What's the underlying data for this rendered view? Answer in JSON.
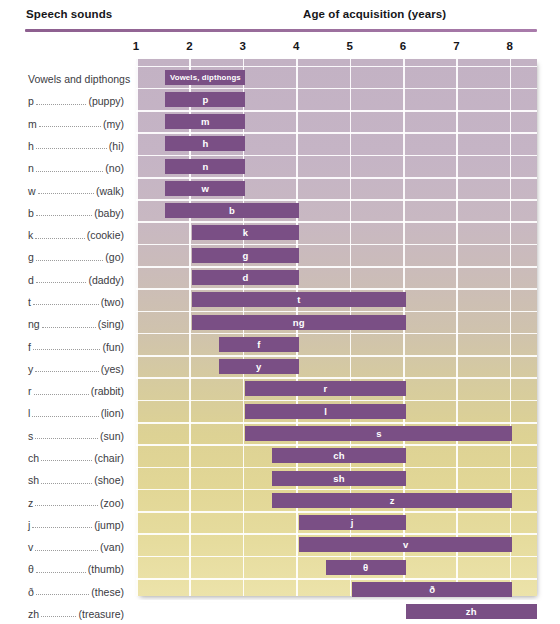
{
  "header": {
    "speech_sounds_label": "Speech sounds",
    "age_label": "Age of acquisition (years)"
  },
  "axis": {
    "ticks": [
      "1",
      "2",
      "3",
      "4",
      "5",
      "6",
      "7",
      "8"
    ],
    "tick_values": [
      1,
      2,
      3,
      4,
      5,
      6,
      7,
      8
    ],
    "xmin": 1,
    "xmax": 8.5,
    "rule_color": "#8d5f8f"
  },
  "colors": {
    "bar": "#7a4f85",
    "bar_text": "#ffffff",
    "grid": "#ffffff",
    "plot_top": "#c3b2c4",
    "plot_bottom": "#ecE3aa",
    "label_text": "#3b3b3f"
  },
  "chart_data": {
    "type": "bar",
    "title": "Age of acquisition (years)",
    "xlabel": "Age of acquisition (years)",
    "ylabel": "Speech sounds",
    "xlim": [
      1,
      8.5
    ],
    "grid": true,
    "legend": "none",
    "orientation": "horizontal",
    "bar_kind": "range",
    "categories": [
      "Vowels and dipthongs",
      "p",
      "m",
      "h",
      "n",
      "w",
      "b",
      "k",
      "g",
      "d",
      "t",
      "ng",
      "f",
      "y",
      "r",
      "l",
      "s",
      "ch",
      "sh",
      "z",
      "j",
      "v",
      "θ",
      "ð",
      "zh"
    ],
    "rows": [
      {
        "symbol": "Vowels and dipthongs",
        "word": "",
        "bar_label": "Vowels, dipthongs",
        "start": 1.55,
        "end": 3.05,
        "dotted": false
      },
      {
        "symbol": "p",
        "word": "(puppy)",
        "bar_label": "p",
        "start": 1.55,
        "end": 3.05,
        "dotted": true
      },
      {
        "symbol": "m",
        "word": "(my)",
        "bar_label": "m",
        "start": 1.55,
        "end": 3.05,
        "dotted": true
      },
      {
        "symbol": "h",
        "word": "(hi)",
        "bar_label": "h",
        "start": 1.55,
        "end": 3.05,
        "dotted": true
      },
      {
        "symbol": "n",
        "word": "(no)",
        "bar_label": "n",
        "start": 1.55,
        "end": 3.05,
        "dotted": true
      },
      {
        "symbol": "w",
        "word": "(walk)",
        "bar_label": "w",
        "start": 1.55,
        "end": 3.05,
        "dotted": true
      },
      {
        "symbol": "b",
        "word": "(baby)",
        "bar_label": "b",
        "start": 1.55,
        "end": 4.05,
        "dotted": true
      },
      {
        "symbol": "k",
        "word": "(cookie)",
        "bar_label": "k",
        "start": 2.05,
        "end": 4.05,
        "dotted": true
      },
      {
        "symbol": "g",
        "word": "(go)",
        "bar_label": "g",
        "start": 2.05,
        "end": 4.05,
        "dotted": true
      },
      {
        "symbol": "d",
        "word": "(daddy)",
        "bar_label": "d",
        "start": 2.05,
        "end": 4.05,
        "dotted": true
      },
      {
        "symbol": "t",
        "word": "(two)",
        "bar_label": "t",
        "start": 2.05,
        "end": 6.05,
        "dotted": true
      },
      {
        "symbol": "ng",
        "word": "(sing)",
        "bar_label": "ng",
        "start": 2.05,
        "end": 6.05,
        "dotted": true
      },
      {
        "symbol": "f",
        "word": "(fun)",
        "bar_label": "f",
        "start": 2.55,
        "end": 4.05,
        "dotted": true
      },
      {
        "symbol": "y",
        "word": "(yes)",
        "bar_label": "y",
        "start": 2.55,
        "end": 4.05,
        "dotted": true
      },
      {
        "symbol": "r",
        "word": "(rabbit)",
        "bar_label": "r",
        "start": 3.05,
        "end": 6.05,
        "dotted": true
      },
      {
        "symbol": "l",
        "word": "(lion)",
        "bar_label": "l",
        "start": 3.05,
        "end": 6.05,
        "dotted": true
      },
      {
        "symbol": "s",
        "word": "(sun)",
        "bar_label": "s",
        "start": 3.05,
        "end": 8.05,
        "dotted": true
      },
      {
        "symbol": "ch",
        "word": "(chair)",
        "bar_label": "ch",
        "start": 3.55,
        "end": 6.05,
        "dotted": true
      },
      {
        "symbol": "sh",
        "word": "(shoe)",
        "bar_label": "sh",
        "start": 3.55,
        "end": 6.05,
        "dotted": true
      },
      {
        "symbol": "z",
        "word": "(zoo)",
        "bar_label": "z",
        "start": 3.55,
        "end": 8.05,
        "dotted": true
      },
      {
        "symbol": "j",
        "word": "(jump)",
        "bar_label": "j",
        "start": 4.05,
        "end": 6.05,
        "dotted": true
      },
      {
        "symbol": "v",
        "word": "(van)",
        "bar_label": "v",
        "start": 4.05,
        "end": 8.05,
        "dotted": true
      },
      {
        "symbol": "θ",
        "word": "(thumb)",
        "bar_label": "θ",
        "start": 4.55,
        "end": 6.05,
        "dotted": true
      },
      {
        "symbol": "ð",
        "word": "(these)",
        "bar_label": "ð",
        "start": 5.05,
        "end": 8.05,
        "dotted": true
      },
      {
        "symbol": "zh",
        "word": "(treasure)",
        "bar_label": "zh",
        "start": 6.05,
        "end": 8.55,
        "dotted": true
      }
    ]
  }
}
